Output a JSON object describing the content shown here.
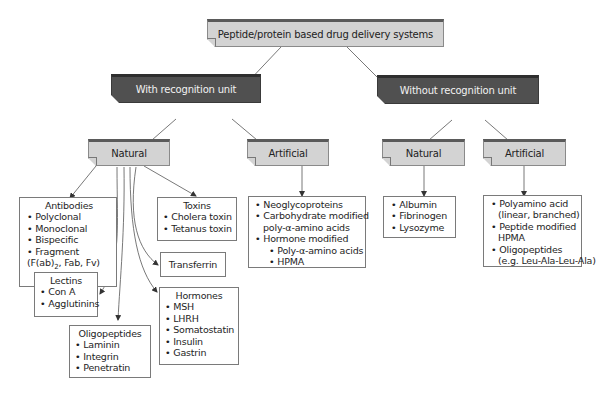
{
  "root": {
    "label": "Peptide/protein based drug delivery systems"
  },
  "level1": [
    {
      "label": "With recognition unit"
    },
    {
      "label": "Without recognition unit"
    }
  ],
  "level2": [
    {
      "label": "Natural"
    },
    {
      "label": "Artificial"
    },
    {
      "label": "Natural"
    },
    {
      "label": "Artificial"
    }
  ],
  "leaves": {
    "antibodies": {
      "title": "Antibodies",
      "items": [
        "Polyclonal",
        "Monoclonal",
        "Bispecific",
        "Fragment"
      ],
      "continuation": "(F(ab)",
      "continuation_sub": "2",
      "continuation_rest": ", Fab, Fv)"
    },
    "toxins": {
      "title": "Toxins",
      "items": [
        "Cholera toxin",
        "Tetanus toxin"
      ]
    },
    "transferrin": {
      "title": "Transferrin"
    },
    "lectins": {
      "title": "Lectins",
      "items": [
        "Con A",
        "Agglutinins"
      ]
    },
    "hormones": {
      "title": "Hormones",
      "items": [
        "MSH",
        "LHRH",
        "Somatostatin",
        "Insulin",
        "Gastrin"
      ]
    },
    "oligopeptides": {
      "title": "Oligopeptides",
      "items": [
        "Laminin",
        "Integrin",
        "Penetratin"
      ]
    },
    "artificial_recognition": {
      "items": [
        {
          "text": "Neoglycoproteins",
          "type": "bullet"
        },
        {
          "text": "Carbohydrate modified",
          "type": "bullet"
        },
        {
          "text": "poly-α-amino acids",
          "type": "cont"
        },
        {
          "text": "Hormone modified",
          "type": "bullet"
        },
        {
          "text": "Poly-α-amino acids",
          "type": "sub"
        },
        {
          "text": "HPMA",
          "type": "sub"
        }
      ]
    },
    "natural_no_recognition": {
      "items": [
        "Albumin",
        "Fibrinogen",
        "Lysozyme"
      ]
    },
    "artificial_no_recognition": {
      "items": [
        {
          "text": "Polyamino acid",
          "type": "bullet"
        },
        {
          "text": "(linear, branched)",
          "type": "cont"
        },
        {
          "text": "Peptide modified",
          "type": "bullet"
        },
        {
          "text": "HPMA",
          "type": "cont"
        },
        {
          "text": "Oligopeptides",
          "type": "bullet"
        },
        {
          "text": "(e.g. Leu-Ala-Leu-Ala)",
          "type": "cont"
        }
      ]
    }
  },
  "colors": {
    "light_box": "#d3d3d3",
    "dark_box": "#505050",
    "top_band": "#5a5a5a",
    "line": "#555555"
  }
}
